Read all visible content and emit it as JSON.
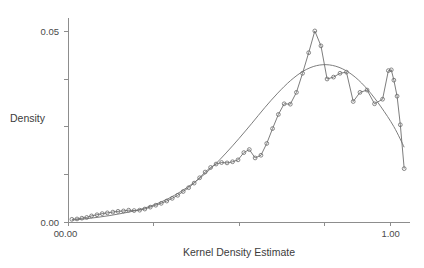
{
  "chart_data": {
    "type": "line",
    "title": "",
    "xlabel": "Kernel Density Estimate",
    "ylabel": "Density",
    "xlim": [
      0.0,
      1.06
    ],
    "ylim": [
      0.0,
      0.0535
    ],
    "grid": false,
    "legend": false,
    "x_ticks": [
      0.0,
      0.265,
      0.53,
      0.795,
      1.0
    ],
    "x_tick_labels": [
      "0.00",
      "",
      "",
      "",
      "1.00"
    ],
    "y_ticks": [
      0.0,
      0.0125,
      0.025,
      0.0375,
      0.05
    ],
    "y_tick_labels": [
      "0.00",
      "",
      "",
      "",
      "0.05"
    ],
    "y_axis_origin_label": "0",
    "series": [
      {
        "name": "empirical-kernel-density",
        "style": "line-with-open-circle-markers",
        "color": "#6a6a6a",
        "x": [
          0.012,
          0.028,
          0.043,
          0.058,
          0.073,
          0.09,
          0.106,
          0.122,
          0.139,
          0.155,
          0.172,
          0.188,
          0.205,
          0.222,
          0.238,
          0.255,
          0.272,
          0.289,
          0.306,
          0.323,
          0.34,
          0.357,
          0.374,
          0.391,
          0.408,
          0.425,
          0.442,
          0.459,
          0.476,
          0.493,
          0.51,
          0.527,
          0.545,
          0.562,
          0.58,
          0.598,
          0.616,
          0.634,
          0.652,
          0.67,
          0.689,
          0.708,
          0.727,
          0.746,
          0.765,
          0.784,
          0.803,
          0.823,
          0.843,
          0.863,
          0.884,
          0.905,
          0.927,
          0.95,
          0.975,
          0.993,
          1.002
        ],
        "y": [
          0.0007,
          0.0008,
          0.001,
          0.0012,
          0.0016,
          0.0019,
          0.0022,
          0.0024,
          0.0026,
          0.0028,
          0.0029,
          0.0031,
          0.003,
          0.0031,
          0.0034,
          0.0039,
          0.0044,
          0.0049,
          0.0055,
          0.0062,
          0.007,
          0.008,
          0.009,
          0.0102,
          0.0116,
          0.0131,
          0.0143,
          0.0152,
          0.0156,
          0.0155,
          0.0158,
          0.0163,
          0.0182,
          0.019,
          0.0168,
          0.0175,
          0.0206,
          0.0245,
          0.0282,
          0.031,
          0.0309,
          0.034,
          0.039,
          0.0444,
          0.0501,
          0.0462,
          0.0375,
          0.038,
          0.039,
          0.0393,
          0.0316,
          0.034,
          0.0346,
          0.031,
          0.0322,
          0.0397,
          0.0399
        ],
        "x_tail": [
          1.01,
          1.02,
          1.03,
          1.042
        ],
        "y_tail": [
          0.0372,
          0.033,
          0.0255,
          0.014
        ]
      },
      {
        "name": "smooth-fitted-density",
        "style": "line",
        "color": "#7b7b7b",
        "x": [
          0.012,
          0.05,
          0.09,
          0.13,
          0.17,
          0.21,
          0.25,
          0.29,
          0.33,
          0.37,
          0.41,
          0.45,
          0.49,
          0.53,
          0.57,
          0.61,
          0.65,
          0.69,
          0.73,
          0.77,
          0.81,
          0.85,
          0.89,
          0.93,
          0.97,
          1.01,
          1.042
        ],
        "y": [
          0.0005,
          0.0008,
          0.0012,
          0.0017,
          0.0023,
          0.003,
          0.004,
          0.0053,
          0.007,
          0.0091,
          0.0116,
          0.0146,
          0.0181,
          0.0219,
          0.0259,
          0.03,
          0.0338,
          0.0371,
          0.0396,
          0.041,
          0.0412,
          0.0402,
          0.038,
          0.0346,
          0.0302,
          0.025,
          0.0196
        ]
      }
    ]
  }
}
